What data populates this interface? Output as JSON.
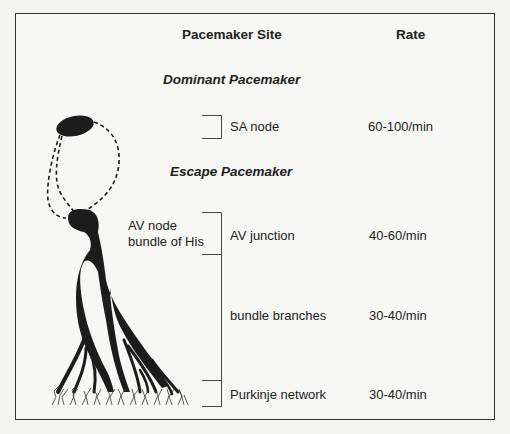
{
  "headers": {
    "site": "Pacemaker Site",
    "rate": "Rate"
  },
  "sections": {
    "dominant": "Dominant Pacemaker",
    "escape": "Escape Pacemaker"
  },
  "anatomy_labels": {
    "av_node": "AV node",
    "bundle_of_his": "bundle of His"
  },
  "rows": [
    {
      "site": "SA node",
      "rate": "60-100/min"
    },
    {
      "site": "AV junction",
      "rate": "40-60/min"
    },
    {
      "site": "bundle branches",
      "rate": "30-40/min"
    },
    {
      "site": "Purkinje network",
      "rate": "30-40/min"
    }
  ],
  "colors": {
    "ink": "#222222",
    "background": "#f7f7f5",
    "frame": "#333333"
  }
}
